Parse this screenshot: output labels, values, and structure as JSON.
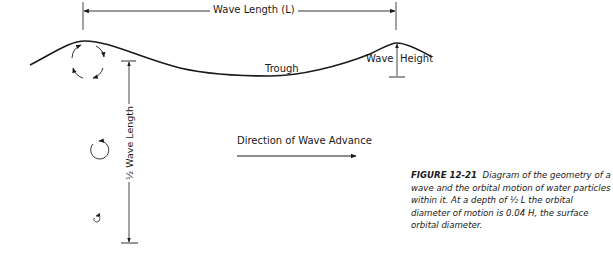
{
  "labels": {
    "wave_length": "Wave Length (L)",
    "trough": "Trough",
    "wave_height_left": "Wave",
    "wave_height_right": "Height",
    "half_wave_length": "½ Wave Length",
    "direction": "Direction of  Wave Advance"
  },
  "caption": {
    "figure_id": "FIGURE 12-21",
    "text": "Diagram of the geometry of a wave and the orbital motion of water particles within it. At a depth of ½ L the orbital diameter of motion is 0.04 H, the surface orbital diameter."
  },
  "colors": {
    "line": "#1a1a1a",
    "background": "#ffffff"
  }
}
